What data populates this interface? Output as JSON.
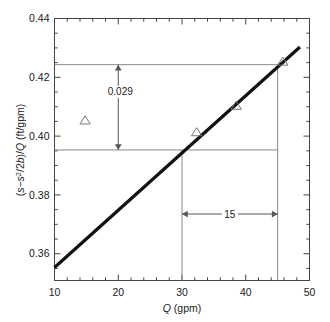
{
  "chart_data": {
    "type": "scatter",
    "title": "",
    "subtitle": "",
    "xlabel": "Q (gpm)",
    "xlabel_italic_part": "Q",
    "xlabel_rest": " (gpm)",
    "ylabel": "(s−s²/2b)/Q (ft/gpm)",
    "ylabel_parts": {
      "open": "(",
      "s1": "s",
      "minus": "−",
      "s2": "s",
      "exp": "2",
      "slash_2b": "/2",
      "b": "b",
      "close_paren": ")/",
      "Q": "Q",
      "units": " (ft/gpm)"
    },
    "xlim": [
      10,
      50
    ],
    "ylim": [
      0.3509,
      0.44
    ],
    "x_major_ticks": [
      10,
      20,
      30,
      40,
      50
    ],
    "x_major_tick_labels": [
      "10",
      "20",
      "30",
      "40",
      "50"
    ],
    "x_minor_tick_step": 2,
    "y_major_ticks": [
      0.36,
      0.38,
      0.4,
      0.42,
      0.44
    ],
    "y_major_tick_labels": [
      "0.36",
      "0.38",
      "0.40",
      "0.42",
      "0.44"
    ],
    "y_minor_tick_step": 0.005,
    "grid": false,
    "legend": null,
    "series": [
      {
        "name": "measured data",
        "marker": "triangle-up",
        "points": [
          {
            "x": 14.8,
            "y": 0.4053
          },
          {
            "x": 32.3,
            "y": 0.4013
          },
          {
            "x": 38.5,
            "y": 0.4103
          },
          {
            "x": 45.8,
            "y": 0.4253
          }
        ]
      },
      {
        "name": "fitted straight line",
        "marker": "none",
        "line_style": "thick-solid",
        "points": [
          {
            "x": 10.0,
            "y": 0.3553
          },
          {
            "x": 48.5,
            "y": 0.4303
          }
        ]
      }
    ],
    "annotations": [
      {
        "name": "vertical-rise-annotation",
        "label": "0.029",
        "type": "double-arrow-vertical",
        "x": 20.0,
        "y_from": 0.3953,
        "y_to": 0.4243,
        "value": 0.029
      },
      {
        "name": "horizontal-run-annotation",
        "label": "15",
        "type": "double-arrow-horizontal",
        "y": 0.3735,
        "x_from": 30,
        "x_to": 45,
        "value": 15
      },
      {
        "name": "upper-guide-line",
        "label": "",
        "type": "horizontal-guide",
        "y": 0.4243
      },
      {
        "name": "lower-guide-line",
        "label": "",
        "type": "horizontal-guide",
        "y": 0.3953
      },
      {
        "name": "left-drop-line",
        "label": "",
        "type": "vertical-guide",
        "x": 30
      },
      {
        "name": "right-drop-line",
        "label": "",
        "type": "vertical-guide",
        "x": 45
      }
    ],
    "colors": {
      "line": "#111111",
      "guide": "#8a8a8a",
      "axis": "#444444",
      "marker": "#777777",
      "text": "#1a1a1a",
      "background": "#ffffff"
    }
  }
}
